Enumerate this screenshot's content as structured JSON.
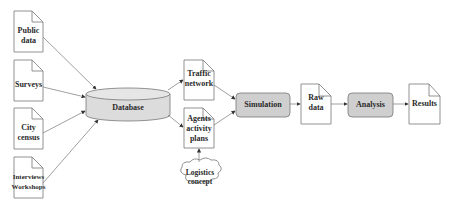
{
  "diagram": {
    "inputs": [
      {
        "id": "public-data",
        "lines": [
          "Public",
          "data"
        ]
      },
      {
        "id": "surveys",
        "lines": [
          "Surveys"
        ]
      },
      {
        "id": "city-census",
        "lines": [
          "City",
          "census"
        ]
      },
      {
        "id": "interviews-workshops",
        "lines": [
          "Interviews",
          "Workshops"
        ]
      }
    ],
    "database": {
      "label": "Database"
    },
    "traffic_network": {
      "lines": [
        "Traffic",
        "network"
      ]
    },
    "agents_activity_plans": {
      "lines": [
        "Agents",
        "activity",
        "plans"
      ]
    },
    "logistics_concept": {
      "lines": [
        "Logistics",
        "concept"
      ]
    },
    "simulation": {
      "label": "Simulation"
    },
    "raw_data": {
      "lines": [
        "Raw",
        "data"
      ]
    },
    "analysis": {
      "label": "Analysis"
    },
    "results": {
      "lines": [
        "Results"
      ]
    },
    "colors": {
      "process_fill": "#cfcfcf",
      "database_fill": "#dcdcdc",
      "stroke": "#555555",
      "arrow": "#666666"
    }
  }
}
